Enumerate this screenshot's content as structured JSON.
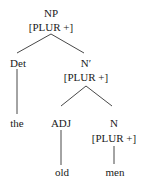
{
  "tree": {
    "root": {
      "label": "NP",
      "feature": "[PLUR +]"
    },
    "det": {
      "label": "Det",
      "word": "the"
    },
    "nbar": {
      "label": "N′",
      "feature": "[PLUR +]"
    },
    "adj": {
      "label": "ADJ",
      "word": "old"
    },
    "noun": {
      "label": "N",
      "feature": "[PLUR +]",
      "word": "men"
    }
  }
}
